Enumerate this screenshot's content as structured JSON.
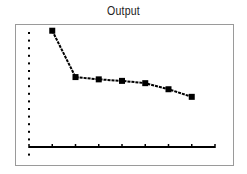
{
  "chart_data": {
    "type": "line",
    "title": "Output",
    "xlabel": "",
    "ylabel": "",
    "x": [
      1,
      2,
      3,
      4,
      5,
      6,
      7
    ],
    "series": [
      {
        "name": "Output",
        "values": [
          15.3,
          9.2,
          8.9,
          8.7,
          8.4,
          7.6,
          6.6
        ],
        "marker": "square"
      }
    ],
    "xlim": [
      0,
      8
    ],
    "ylim": [
      -1.3,
      15.5
    ],
    "x_ticks": [
      0,
      1,
      2,
      3,
      4,
      5,
      6,
      7,
      8
    ],
    "y_axis_style": "dotted",
    "grid": false,
    "legend": "none",
    "colors": {
      "line": "#000000",
      "axis": "#000000",
      "frame": "#9a9a9a"
    }
  }
}
